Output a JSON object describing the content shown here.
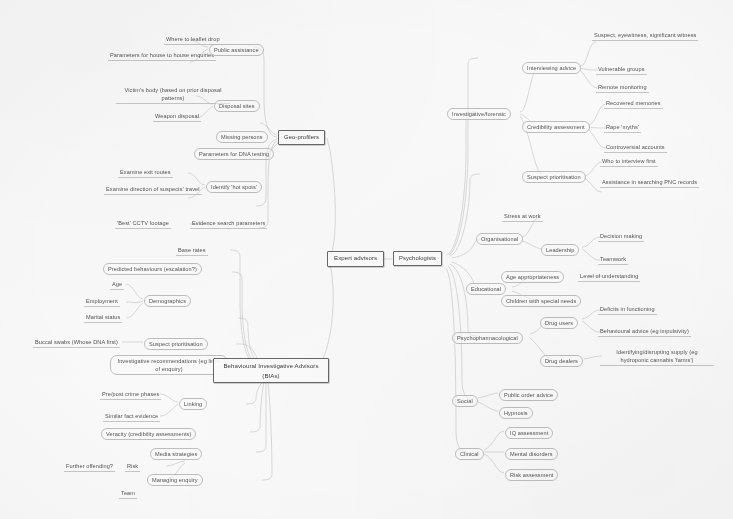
{
  "diagram": {
    "root": {
      "label": "Expert advisors"
    },
    "colors": {
      "ink": "#3a3a3a",
      "node_border": "#555555",
      "leaf_rule": "#c2c2c2",
      "background": "#ffffff"
    }
  },
  "nodes": {
    "root": "Expert advisors",
    "geo_profilers": "Geo-profilers",
    "bias": "Behavioural Investigative Advisors (BIAs)",
    "psychologists": "Psychologists"
  },
  "geo": {
    "public_assistance": "Public assistance",
    "where_to_leaflet_drop": "Where to leaflet drop",
    "parameters_house": "Parameters for house to house enquiries",
    "disposal_sites": "Disposal sites",
    "victims_body": "Victim's body (based on prior disposal patterns)",
    "weapon_disposal": "Weapon disposal",
    "missing_persons": "Missing persons",
    "parameters_dna": "Parameters for DNA testing",
    "identify_hot_spots": "Identify 'hot spots'",
    "examine_exit_routes": "Examine exit routes",
    "examine_direction": "Examine direction of suspects' travel",
    "evidence_search_parameters": "Evidence search parameters",
    "best_cctv_footage": "'Best' CCTV footage"
  },
  "bia": {
    "base_rates": "Base rates",
    "predicted_behaviours": "Predicted behaviours (escalation?)",
    "demographics": "Demographics",
    "age": "Age",
    "employment": "Employment",
    "marital_status": "Marital status",
    "suspect_prioritisation": "Suspect prioritisation",
    "buccal_swabs": "Buccal swabs (Whose DNA first)",
    "investigative_recommendations": "Investigative recommendations (eg lines of enquiry)",
    "linking": "Linking",
    "pre_post_crime_phases": "Pre/post crime phases",
    "similar_fact_evidence": "Similar fact evidence",
    "veracity": "Veracity (credibility assessments)",
    "media_strategies": "Media strategies",
    "managing_enquiry": "Managing enquiry",
    "risk": "Risk",
    "further_offending": "Further offending?",
    "team": "Team"
  },
  "psych": {
    "investigative_forensic": "Investigative/forensic",
    "interviewing_advice": "Interviewing advice",
    "suspect_eyewitness": "Suspect, eyewitness, significant witness",
    "vulnerable_groups": "Vulnerable groups",
    "remote_monitoring": "Remote monitoring",
    "credibility_assessment": "Credibility assessment",
    "recovered_memories": "Recovered memories",
    "rape_myths": "Rape 'myths'",
    "controversial_accounts": "Controversial accounts",
    "suspect_prioritisation": "Suspect prioritisation",
    "who_to_interview_first": "Who to interview first",
    "assistance_pnc": "Assistance in searching PNC records",
    "organisational": "Organisational",
    "stress_at_work": "Stress at work",
    "leadership": "Leadership",
    "decision_making": "Decision making",
    "teamwork": "Teamwork",
    "educational": "Educational",
    "age_appropriateness": "Age appropriateness",
    "level_of_understanding": "Level of understanding",
    "children_special_needs": "Children with special needs",
    "psychopharmacological": "Psychopharmacological",
    "drug_users": "Drug users",
    "deficits_in_functioning": "Deficits in functioning",
    "behavioural_advice": "Behavioural advice (eg impulsivity)",
    "drug_dealers": "Drug dealers",
    "identifying_supply": "Identifying/disrupting supply (eg hydroponic cannabis 'farms')",
    "social": "Social",
    "public_order_advice": "Public order advice",
    "hypnosis": "Hypnosis",
    "clinical": "Clinical",
    "iq_assessment": "IQ assessment",
    "mental_disorders": "Mental disorders",
    "risk_assessment": "Risk assessment"
  }
}
